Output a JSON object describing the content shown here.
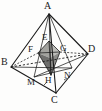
{
  "figure": {
    "kind": "geometry-diagram",
    "colors": {
      "stroke": "#1b1b1b",
      "label": "#1b1b1b",
      "shade_light": "#b9b9b6",
      "shade_mid": "#9a9a97",
      "shade_dark": "#6f6f6d",
      "background": "#fdfdfc"
    },
    "labels": [
      {
        "name": "A",
        "text": "A",
        "x": 44,
        "y": 1
      },
      {
        "name": "B",
        "text": "B",
        "x": 1,
        "y": 57
      },
      {
        "name": "C",
        "text": "C",
        "x": 51,
        "y": 96
      },
      {
        "name": "D",
        "text": "D",
        "x": 88,
        "y": 44
      },
      {
        "name": "E",
        "text": "E",
        "x": 42,
        "y": 34
      },
      {
        "name": "F",
        "text": "F",
        "x": 29,
        "y": 45
      },
      {
        "name": "G",
        "text": "G",
        "x": 60,
        "y": 45
      },
      {
        "name": "H",
        "text": "H",
        "x": 46,
        "y": 77
      },
      {
        "name": "M",
        "text": "M",
        "x": 28,
        "y": 79
      },
      {
        "name": "N",
        "text": "N",
        "x": 64,
        "y": 72
      }
    ],
    "vertices": {
      "A": {
        "x": 49,
        "y": 14
      },
      "B": {
        "x": 11,
        "y": 67
      },
      "C": {
        "x": 56,
        "y": 93
      },
      "D": {
        "x": 88,
        "y": 54
      },
      "E": {
        "x": 49,
        "y": 41
      },
      "F": {
        "x": 38,
        "y": 53
      },
      "G": {
        "x": 60,
        "y": 52
      },
      "H": {
        "x": 51,
        "y": 75
      },
      "M": {
        "x": 34,
        "y": 77
      },
      "N": {
        "x": 72,
        "y": 68
      },
      "Pleft": {
        "x": 40,
        "y": 57
      },
      "Pright": {
        "x": 61,
        "y": 56
      }
    },
    "edges": [
      {
        "name": "edge-A-B",
        "from": "A",
        "to": "B",
        "style": "solid"
      },
      {
        "name": "edge-A-C",
        "from": "A",
        "to": "C",
        "style": "solid"
      },
      {
        "name": "edge-A-D",
        "from": "A",
        "to": "D",
        "style": "solid"
      },
      {
        "name": "edge-B-C",
        "from": "B",
        "to": "C",
        "style": "solid"
      },
      {
        "name": "edge-C-D",
        "from": "C",
        "to": "D",
        "style": "solid"
      },
      {
        "name": "edge-B-D",
        "from": "B",
        "to": "D",
        "style": "dashed"
      },
      {
        "name": "edge-A-H",
        "from": "A",
        "to": "H",
        "style": "solid"
      },
      {
        "name": "edge-A-M",
        "from": "A",
        "to": "M",
        "style": "solid"
      },
      {
        "name": "edge-A-N",
        "from": "A",
        "to": "N",
        "style": "solid"
      },
      {
        "name": "edge-B-N",
        "from": "B",
        "to": "N",
        "style": "solid"
      },
      {
        "name": "edge-M-D",
        "from": "M",
        "to": "D",
        "style": "solid"
      },
      {
        "name": "edge-F-G",
        "from": "F",
        "to": "G",
        "style": "solid"
      },
      {
        "name": "edge-E-H",
        "from": "E",
        "to": "H",
        "style": "solid"
      }
    ],
    "shaded_faces": [
      {
        "name": "octa-face-upper-left",
        "tone": "shade_mid",
        "points": "49,41 38,53 49,57"
      },
      {
        "name": "octa-face-upper-right",
        "tone": "shade_light",
        "points": "49,41 60,52 49,57"
      },
      {
        "name": "octa-face-lower-left",
        "tone": "shade_dark",
        "points": "38,53 51,75 49,57"
      },
      {
        "name": "octa-face-lower-right",
        "tone": "shade_mid",
        "points": "60,52 51,75 49,57"
      }
    ]
  }
}
